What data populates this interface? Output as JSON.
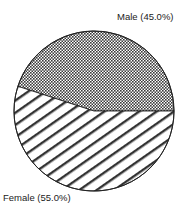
{
  "chart_data": {
    "type": "pie",
    "title": "",
    "categories": [
      "Male",
      "Female"
    ],
    "values": [
      45.0,
      55.0
    ],
    "labels": [
      "Male (45.0%)",
      "Female (55.0%)"
    ],
    "patterns": [
      "crosshatch",
      "diagonal-stripes"
    ],
    "legend": "none",
    "start_angle_deg": 0,
    "direction": "counterclockwise"
  },
  "colors": {
    "outline": "#222222",
    "pattern_ink": "#333333",
    "background": "#ffffff"
  }
}
